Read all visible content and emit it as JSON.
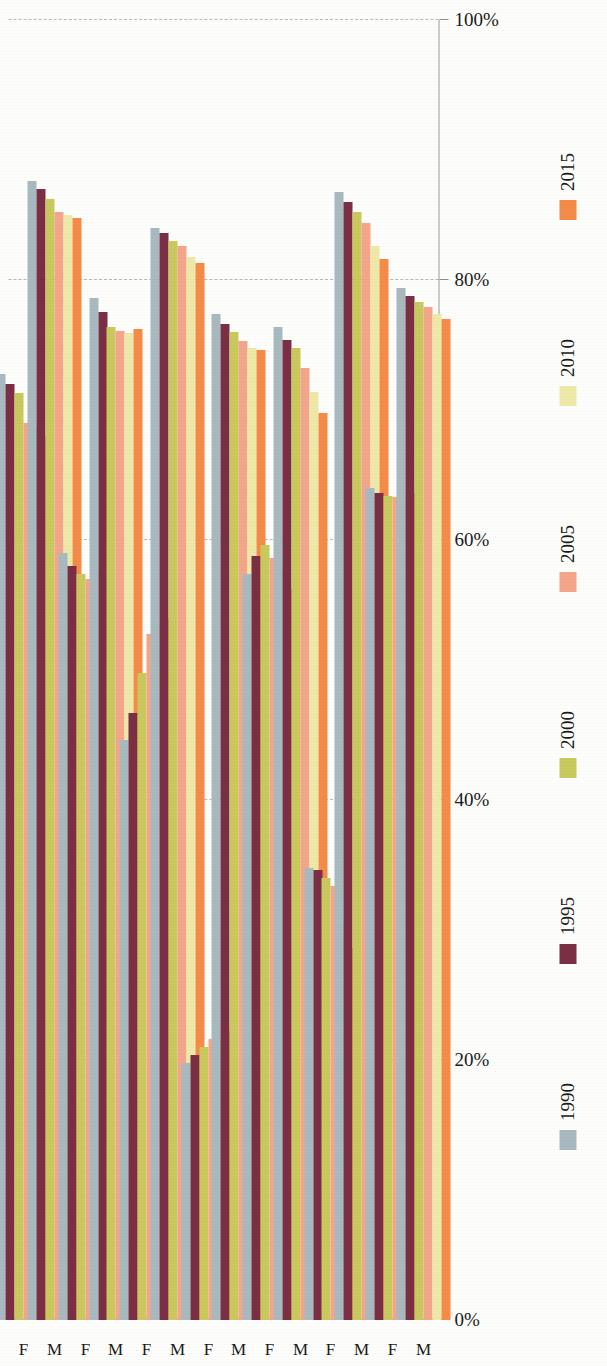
{
  "chart_data": {
    "type": "bar",
    "orientation": "horizontal",
    "title": "",
    "xlabel": "",
    "ylabel": "",
    "ylim": [
      0,
      100
    ],
    "ticks": [
      "0%",
      "20%",
      "40%",
      "60%",
      "80%",
      "100%"
    ],
    "tick_values": [
      0,
      20,
      40,
      60,
      80,
      100
    ],
    "grid": true,
    "legend_position": "bottom",
    "series": [
      {
        "name": "1990",
        "color": "#a8b9c0"
      },
      {
        "name": "1995",
        "color": "#7b2f45"
      },
      {
        "name": "2000",
        "color": "#c9c95e"
      },
      {
        "name": "2005",
        "color": "#f4a68a"
      },
      {
        "name": "2010",
        "color": "#efe9a8"
      },
      {
        "name": "2015",
        "color": "#f58b48"
      }
    ],
    "categories": [
      {
        "region": "East Asia and the Pacific",
        "sex": "F"
      },
      {
        "region": "East Asia and the Pacific",
        "sex": "M"
      },
      {
        "region": "Europe and Central Asia",
        "sex": "F"
      },
      {
        "region": "Europe and Central Asia",
        "sex": "M"
      },
      {
        "region": "Latin America and the Caribbean",
        "sex": "F"
      },
      {
        "region": "Latin America and the Caribbean",
        "sex": "M"
      },
      {
        "region": "Middle East and North Africa",
        "sex": "F"
      },
      {
        "region": "Middle East and North Africa",
        "sex": "M"
      },
      {
        "region": "North America",
        "sex": "F"
      },
      {
        "region": "North America",
        "sex": "M"
      },
      {
        "region": "South Asia",
        "sex": "F"
      },
      {
        "region": "South Asia",
        "sex": "M"
      },
      {
        "region": "Sub-Saharan Africa",
        "sex": "F"
      },
      {
        "region": "Sub-Saharan Africa",
        "sex": "M"
      }
    ],
    "groups": [
      {
        "region": "East Asia and the Pacific",
        "sex": "F",
        "values": {
          "1990": 72.8,
          "1995": 72.0,
          "2000": 71.3,
          "2005": 69.0,
          "2010": 68.6,
          "2015": 68.0
        }
      },
      {
        "region": "East Asia and the Pacific",
        "sex": "M",
        "values": {
          "1990": 87.6,
          "1995": 87.0,
          "2000": 86.2,
          "2005": 85.2,
          "2010": 85.0,
          "2015": 84.8
        }
      },
      {
        "region": "Europe and Central Asia",
        "sex": "F",
        "values": {
          "1990": 59.0,
          "1995": 58.0,
          "2000": 57.4,
          "2005": 57.0,
          "2010": 57.5,
          "2015": 58.4
        }
      },
      {
        "region": "Europe and Central Asia",
        "sex": "M",
        "values": {
          "1990": 78.6,
          "1995": 77.5,
          "2000": 76.4,
          "2005": 76.1,
          "2010": 75.9,
          "2015": 76.2
        }
      },
      {
        "region": "Latin America and the Caribbean",
        "sex": "F",
        "values": {
          "1990": 44.6,
          "1995": 46.7,
          "2000": 49.8,
          "2005": 52.8,
          "2010": 53.6,
          "2015": 54.0
        }
      },
      {
        "region": "Latin America and the Caribbean",
        "sex": "M",
        "values": {
          "1990": 84.0,
          "1995": 83.6,
          "2000": 83.0,
          "2005": 82.6,
          "2010": 81.8,
          "2015": 81.3
        }
      },
      {
        "region": "Middle East and North Africa",
        "sex": "F",
        "values": {
          "1990": 19.8,
          "1995": 20.4,
          "2000": 21.0,
          "2005": 21.6,
          "2010": 21.6,
          "2015": 22.2
        }
      },
      {
        "region": "Middle East and North Africa",
        "sex": "M",
        "values": {
          "1990": 77.4,
          "1995": 76.6,
          "2000": 76.0,
          "2005": 75.3,
          "2010": 74.8,
          "2015": 74.6
        }
      },
      {
        "region": "North America",
        "sex": "F",
        "values": {
          "1990": 57.4,
          "1995": 58.8,
          "2000": 59.6,
          "2005": 58.6,
          "2010": 57.6,
          "2015": 56.2
        }
      },
      {
        "region": "North America",
        "sex": "M",
        "values": {
          "1990": 76.4,
          "1995": 75.4,
          "2000": 74.8,
          "2005": 73.2,
          "2010": 71.4,
          "2015": 69.8
        }
      },
      {
        "region": "South Asia",
        "sex": "F",
        "values": {
          "1990": 34.8,
          "1995": 34.6,
          "2000": 34.0,
          "2005": 33.4,
          "2010": 30.6,
          "2015": 28.6
        }
      },
      {
        "region": "South Asia",
        "sex": "M",
        "values": {
          "1990": 86.8,
          "1995": 86.0,
          "2000": 85.2,
          "2005": 84.4,
          "2010": 82.6,
          "2015": 81.6
        }
      },
      {
        "region": "Sub-Saharan Africa",
        "sex": "F",
        "values": {
          "1990": 64.0,
          "1995": 63.6,
          "2000": 63.4,
          "2005": 63.3,
          "2010": 63.4,
          "2015": 63.6
        }
      },
      {
        "region": "Sub-Saharan Africa",
        "sex": "M",
        "values": {
          "1990": 79.4,
          "1995": 78.8,
          "2000": 78.3,
          "2005": 77.9,
          "2010": 77.4,
          "2015": 77.0
        }
      }
    ]
  }
}
